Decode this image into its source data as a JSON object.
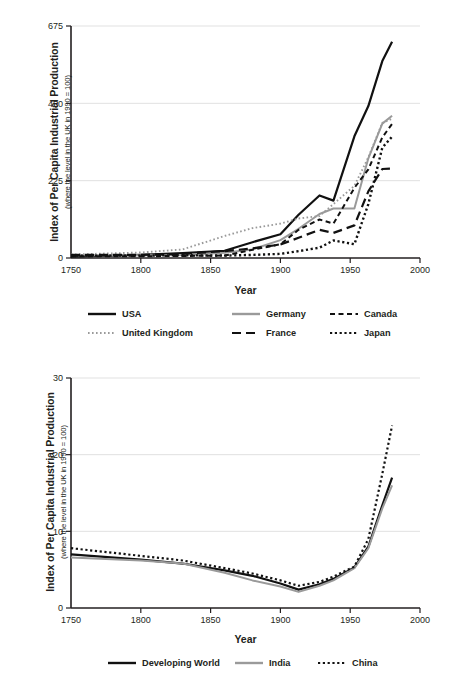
{
  "page": {
    "background": "#ffffff",
    "ink": "#231f20",
    "grid_color": "#d9d9d9",
    "axis_color": "#231f20",
    "gray_series_color": "#9a9a9a",
    "black_series_color": "#111111"
  },
  "chart_data": [
    {
      "id": "industrialised-countries",
      "type": "line",
      "title": "",
      "xlabel": "Year",
      "ylabel": "Index of Per Capita Industrial Production",
      "ylabel_sub": "(where the level in the UK in 1990 = 100)",
      "xlim": [
        1750,
        2000
      ],
      "ylim": [
        0,
        675
      ],
      "xticks": [
        1750,
        1800,
        1850,
        1900,
        1950,
        2000
      ],
      "yticks": [
        0,
        225,
        450,
        675
      ],
      "grid": "horizontal",
      "legend_position": "below",
      "series": [
        {
          "name": "USA",
          "color": "#111111",
          "style": "solid",
          "width": 2.2,
          "x": [
            1750,
            1800,
            1830,
            1860,
            1880,
            1900,
            1913,
            1928,
            1938,
            1953,
            1963,
            1973,
            1980
          ],
          "values": [
            4,
            9,
            14,
            21,
            46,
            69,
            126,
            182,
            167,
            354,
            442,
            573,
            629
          ]
        },
        {
          "name": "United Kingdom",
          "color": "#9a9a9a",
          "style": "dotted",
          "width": 1.9,
          "x": [
            1750,
            1800,
            1830,
            1860,
            1880,
            1900,
            1913,
            1928,
            1938,
            1953,
            1963,
            1973,
            1980
          ],
          "values": [
            10,
            16,
            25,
            64,
            87,
            100,
            115,
            122,
            157,
            210,
            293,
            393,
            405
          ]
        },
        {
          "name": "Germany",
          "color": "#9a9a9a",
          "style": "solid",
          "width": 2.0,
          "x": [
            1750,
            1800,
            1830,
            1860,
            1880,
            1900,
            1913,
            1928,
            1938,
            1953,
            1963,
            1973,
            1980
          ],
          "values": [
            8,
            8,
            9,
            15,
            25,
            52,
            85,
            128,
            144,
            144,
            290,
            391,
            414
          ]
        },
        {
          "name": "France",
          "color": "#111111",
          "style": "dashed",
          "width": 2.2,
          "x": [
            1750,
            1800,
            1830,
            1860,
            1880,
            1900,
            1913,
            1928,
            1938,
            1953,
            1963,
            1973,
            1980
          ],
          "values": [
            9,
            9,
            12,
            20,
            28,
            39,
            59,
            82,
            73,
            95,
            194,
            259,
            260
          ]
        },
        {
          "name": "Canada",
          "color": "#111111",
          "style": "dash-short",
          "width": 2.0,
          "x": [
            1750,
            1800,
            1830,
            1860,
            1880,
            1900,
            1913,
            1928,
            1938,
            1953,
            1963,
            1973,
            1980
          ],
          "values": [
            5,
            5,
            6,
            7,
            24,
            40,
            82,
            112,
            100,
            204,
            258,
            351,
            390
          ]
        },
        {
          "name": "Japan",
          "color": "#111111",
          "style": "dotted-bold",
          "width": 2.4,
          "x": [
            1750,
            1800,
            1830,
            1860,
            1880,
            1900,
            1913,
            1928,
            1938,
            1953,
            1963,
            1973,
            1980
          ],
          "values": [
            7,
            7,
            8,
            7,
            9,
            12,
            20,
            30,
            51,
            40,
            157,
            321,
            353
          ]
        }
      ],
      "legend": [
        {
          "label": "USA",
          "color": "#111111",
          "style": "solid"
        },
        {
          "label": "Germany",
          "color": "#9a9a9a",
          "style": "solid"
        },
        {
          "label": "Canada",
          "color": "#111111",
          "style": "dash-short"
        },
        {
          "label": "United Kingdom",
          "color": "#9a9a9a",
          "style": "dotted"
        },
        {
          "label": "France",
          "color": "#111111",
          "style": "dashed"
        },
        {
          "label": "Japan",
          "color": "#111111",
          "style": "dotted-bold"
        }
      ]
    },
    {
      "id": "developing-countries",
      "type": "line",
      "title": "",
      "xlabel": "Year",
      "ylabel": "Index of Per Capita Industrial Production",
      "ylabel_sub": "(where the level in the UK in 1990 = 100)",
      "xlim": [
        1750,
        2000
      ],
      "ylim": [
        0,
        30
      ],
      "xticks": [
        1750,
        1800,
        1850,
        1900,
        1950,
        2000
      ],
      "yticks": [
        0,
        10,
        20,
        30
      ],
      "grid": "horizontal",
      "legend_position": "below",
      "series": [
        {
          "name": "Developing World",
          "color": "#111111",
          "style": "solid",
          "width": 2.2,
          "x": [
            1750,
            1800,
            1830,
            1860,
            1880,
            1900,
            1913,
            1928,
            1938,
            1953,
            1963,
            1973,
            1980
          ],
          "values": [
            7.0,
            6.3,
            5.8,
            4.9,
            4.2,
            3.2,
            2.4,
            3.1,
            3.8,
            5.3,
            8.0,
            13.4,
            17.0
          ]
        },
        {
          "name": "India",
          "color": "#9a9a9a",
          "style": "solid",
          "width": 2.0,
          "x": [
            1750,
            1800,
            1830,
            1860,
            1880,
            1900,
            1913,
            1928,
            1938,
            1953,
            1963,
            1973,
            1980
          ],
          "values": [
            6.6,
            6.2,
            5.8,
            4.6,
            3.6,
            2.8,
            2.1,
            2.9,
            3.6,
            5.2,
            7.8,
            13.0,
            16.0
          ]
        },
        {
          "name": "China",
          "color": "#111111",
          "style": "dotted-bold",
          "width": 2.2,
          "x": [
            1750,
            1800,
            1830,
            1860,
            1880,
            1900,
            1913,
            1928,
            1938,
            1953,
            1963,
            1973,
            1980
          ],
          "values": [
            7.8,
            6.8,
            6.2,
            5.2,
            4.5,
            3.6,
            2.9,
            3.4,
            4.1,
            5.4,
            9.0,
            17.5,
            23.8
          ]
        }
      ],
      "legend": [
        {
          "label": "Developing World",
          "color": "#111111",
          "style": "solid"
        },
        {
          "label": "India",
          "color": "#9a9a9a",
          "style": "solid"
        },
        {
          "label": "China",
          "color": "#111111",
          "style": "dotted-bold"
        }
      ]
    }
  ]
}
